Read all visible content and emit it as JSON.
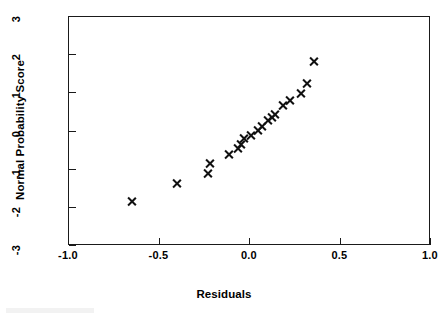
{
  "figure": {
    "background_color": "#ffffff",
    "foreground_color": "#111111",
    "width": 448,
    "height": 318
  },
  "axes": {
    "x_title": "Residuals",
    "y_title": "Normal Probability Score",
    "x_ticks": [
      "-1.0",
      "-0.5",
      "0.0",
      "0.5",
      "1.0"
    ],
    "y_ticks": [
      "3",
      "2",
      "1",
      "0",
      "-1",
      "-2",
      "-3"
    ]
  },
  "chart_data": {
    "type": "scatter",
    "title": "",
    "xlabel": "Residuals",
    "ylabel": "Normal Probability Score",
    "xlim": [
      -1.0,
      1.0
    ],
    "ylim": [
      -3,
      3
    ],
    "xticks": [
      -1.0,
      -0.5,
      0.0,
      0.5,
      1.0
    ],
    "yticks": [
      -3,
      -2,
      -1,
      0,
      1,
      2,
      3
    ],
    "xtick_labels": [
      "-1.0",
      "-0.5",
      "0.0",
      "0.5",
      "1.0"
    ],
    "ytick_labels": [
      "-3",
      "-2",
      "-1",
      "0",
      "1",
      "2",
      "3"
    ],
    "grid": false,
    "legend": null,
    "marker": "x",
    "marker_color": "#111111",
    "series": [
      {
        "name": "residuals",
        "x": [
          -0.65,
          -0.4,
          -0.225,
          -0.215,
          -0.11,
          -0.06,
          -0.045,
          -0.03,
          0.01,
          0.05,
          0.07,
          0.105,
          0.125,
          0.145,
          0.185,
          0.225,
          0.285,
          0.32,
          0.36
        ],
        "y": [
          -1.87,
          -1.4,
          -1.12,
          -0.86,
          -0.62,
          -0.47,
          -0.37,
          -0.21,
          -0.14,
          0.01,
          0.1,
          0.27,
          0.35,
          0.41,
          0.66,
          0.79,
          0.97,
          1.22,
          1.8
        ]
      }
    ],
    "n_points": 19
  }
}
